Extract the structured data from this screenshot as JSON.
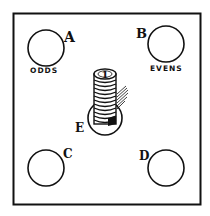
{
  "diagram": {
    "board": {
      "stroke": "#111111",
      "background": "#ffffff"
    },
    "spots": [
      {
        "id": "A",
        "label": "A",
        "caption": "ODDS"
      },
      {
        "id": "B",
        "label": "B",
        "caption": "EVENS"
      },
      {
        "id": "C",
        "label": "C",
        "caption": ""
      },
      {
        "id": "D",
        "label": "D",
        "caption": ""
      },
      {
        "id": "E",
        "label": "E",
        "caption": ""
      }
    ],
    "coin_stack": {
      "top_coin_number": "1"
    }
  }
}
